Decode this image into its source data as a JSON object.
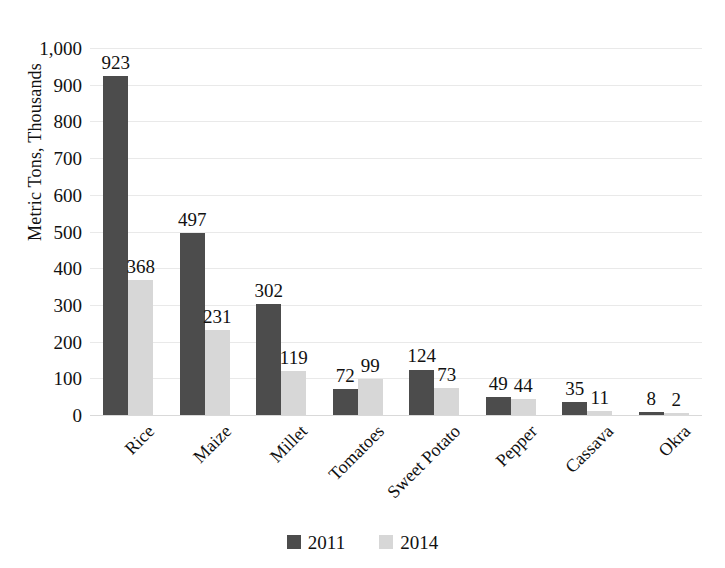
{
  "chart_data": {
    "type": "bar",
    "title": "",
    "subtitle": "",
    "xlabel": "",
    "ylabel": "Metric Tons, Thousands",
    "ylim": [
      0,
      1000
    ],
    "ytick_labels": [
      "1,000",
      "900",
      "800",
      "700",
      "600",
      "500",
      "400",
      "300",
      "200",
      "100",
      "0"
    ],
    "ytick_values": [
      1000,
      900,
      800,
      700,
      600,
      500,
      400,
      300,
      200,
      100,
      0
    ],
    "grid": true,
    "legend_position": "bottom",
    "categories": [
      "Rice",
      "Maize",
      "Millet",
      "Tomatoes",
      "Sweet Potato",
      "Pepper",
      "Cassava",
      "Okra"
    ],
    "series": [
      {
        "name": "2011",
        "color": "#4c4c4c",
        "values": [
          923,
          497,
          302,
          72,
          124,
          49,
          35,
          8
        ]
      },
      {
        "name": "2014",
        "color": "#d7d7d7",
        "values": [
          368,
          231,
          119,
          99,
          73,
          44,
          11,
          2
        ]
      }
    ],
    "data_labels": [
      [
        "923",
        "368"
      ],
      [
        "497",
        "231"
      ],
      [
        "302",
        "119"
      ],
      [
        "72",
        "99"
      ],
      [
        "124",
        "73"
      ],
      [
        "49",
        "44"
      ],
      [
        "35",
        "11"
      ],
      [
        "8",
        "2"
      ]
    ]
  },
  "legend": {
    "items": [
      {
        "label": "2011",
        "color": "#4c4c4c"
      },
      {
        "label": "2014",
        "color": "#d7d7d7"
      }
    ]
  },
  "colors": {
    "series_2011": "#4c4c4c",
    "series_2014": "#d7d7d7",
    "gridline": "#e9e9e9",
    "text": "#111111",
    "background": "#ffffff"
  }
}
